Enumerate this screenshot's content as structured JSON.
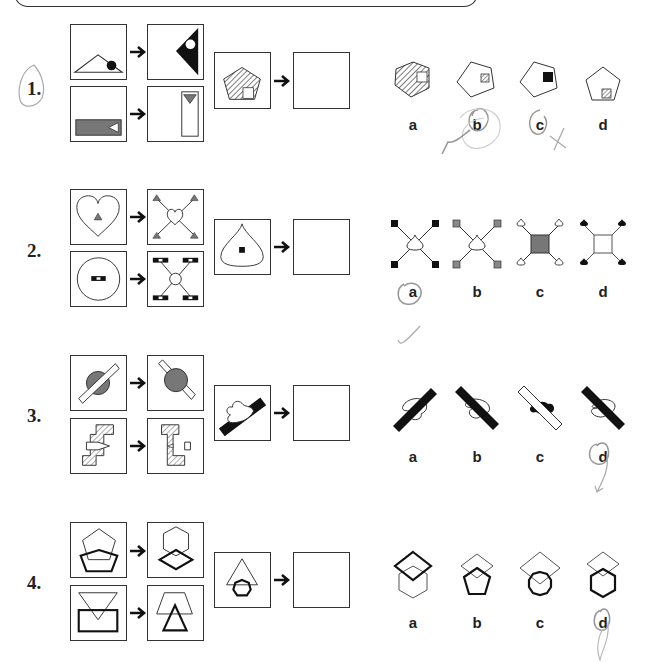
{
  "worksheet": {
    "type": "visual analogy problems",
    "instruction_pattern": "A → B as C → ?",
    "problems": [
      {
        "number": "1.",
        "example_pairs": [
          {
            "from": "outlined triangle with black dot",
            "to": "black triangle pointing left with white dot"
          },
          {
            "from": "gray horizontal rectangle with white triangle",
            "to": "white vertical rectangle with gray triangle"
          }
        ],
        "query": "hatched pentagon with white square",
        "options": [
          {
            "label": "a",
            "desc": "hatched pentagon with white square"
          },
          {
            "label": "b",
            "desc": "white pentagon with hatched square"
          },
          {
            "label": "c",
            "desc": "white pentagon with black square"
          },
          {
            "label": "d",
            "desc": "white pentagon with hatched square at bottom"
          }
        ],
        "pencil_marks": "b circled and scribbled with check, c circled with x"
      },
      {
        "number": "2.",
        "example_pairs": [
          {
            "from": "heart with gray triangle",
            "to": "small heart with four gray triangles on diagonal lines"
          },
          {
            "from": "circle with black-white bar",
            "to": "small circle with four bars on diagonal lines"
          }
        ],
        "query": "drop shape with black square",
        "options": [
          {
            "label": "a",
            "desc": "drop with four black squares"
          },
          {
            "label": "b",
            "desc": "drop with four gray squares"
          },
          {
            "label": "c",
            "desc": "gray square with four drops"
          },
          {
            "label": "d",
            "desc": "white square with four black drops"
          }
        ],
        "pencil_marks": "a circled with check"
      },
      {
        "number": "3.",
        "example_pairs": [
          {
            "from": "gray circle behind white bar",
            "to": "gray circle in front of white bar, mirrored"
          },
          {
            "from": "hatched S-shape with white arrow in front",
            "to": "mirrored hatched shape in front of arrow"
          }
        ],
        "query": "white heart in front of black bar",
        "options": [
          {
            "label": "a",
            "desc": "black bar in front of heart, rising"
          },
          {
            "label": "b",
            "desc": "black bar in front of heart, falling"
          },
          {
            "label": "c",
            "desc": "white bar in front of black heart"
          },
          {
            "label": "d",
            "desc": "black bar in front of heart, mirrored"
          }
        ],
        "pencil_marks": "d circled"
      },
      {
        "number": "4.",
        "example_pairs": [
          {
            "from": "thin pentagon above thick pentagon",
            "to": "thin hexagon above thick diamond"
          },
          {
            "from": "thin inverted triangle above thick rectangle",
            "to": "thin trapezoid above thick triangle"
          }
        ],
        "query": "thin triangle above thick heptagon",
        "options": [
          {
            "label": "a",
            "desc": "thick diamond above thin hexagon"
          },
          {
            "label": "b",
            "desc": "thin diamond above thick pentagon"
          },
          {
            "label": "c",
            "desc": "thin diamond above thick octagon"
          },
          {
            "label": "d",
            "desc": "thin diamond above thick hexagon"
          }
        ],
        "pencil_marks": "d circled"
      }
    ]
  },
  "colors": {
    "ink": "#222222",
    "gray_fill": "#707070",
    "pencil": "#9a9a9a"
  }
}
